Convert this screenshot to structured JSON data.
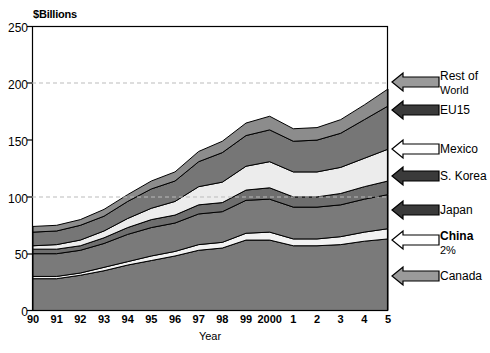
{
  "chart_data": {
    "type": "area",
    "title": "",
    "ylabel": "$Billions",
    "xlabel": "Year",
    "ylim": [
      0,
      250
    ],
    "yticks": [
      "0",
      "50",
      "100",
      "150",
      "200",
      "250"
    ],
    "ytick_values": [
      0,
      50,
      100,
      150,
      200,
      250
    ],
    "grid": "horizontal-dashed-at-100-200",
    "legend_position": "right-with-arrows",
    "categories": [
      "90",
      "91",
      "92",
      "93",
      "94",
      "95",
      "96",
      "97",
      "98",
      "99",
      "2000",
      "1",
      "2",
      "3",
      "4",
      "5"
    ],
    "x": [
      "90",
      "91",
      "92",
      "93",
      "94",
      "95",
      "96",
      "97",
      "98",
      "99",
      "2000",
      "1",
      "2",
      "3",
      "4",
      "5"
    ],
    "stacked": true,
    "series": [
      {
        "name": "Canada",
        "color": "#7a7a7a",
        "values": [
          28,
          28,
          31,
          35,
          40,
          44,
          48,
          53,
          55,
          62,
          62,
          57,
          57,
          58,
          61,
          63
        ]
      },
      {
        "name": "China",
        "color": "#f2f2f2",
        "values": [
          2,
          2,
          2,
          3,
          3,
          4,
          4,
          5,
          5,
          6,
          7,
          6,
          6,
          7,
          8,
          9
        ],
        "note": "2%"
      },
      {
        "name": "Japan",
        "color": "#7a7a7a",
        "values": [
          20,
          20,
          20,
          21,
          24,
          25,
          25,
          27,
          27,
          29,
          29,
          28,
          28,
          28,
          29,
          30
        ]
      },
      {
        "name": "S. Korea",
        "color": "#6e6e6e",
        "values": [
          4,
          4,
          4,
          5,
          6,
          7,
          7,
          8,
          8,
          9,
          10,
          9,
          9,
          10,
          11,
          12
        ]
      },
      {
        "name": "Mexico",
        "color": "#ececec",
        "values": [
          3,
          4,
          5,
          6,
          8,
          10,
          12,
          16,
          18,
          21,
          23,
          22,
          22,
          23,
          25,
          28
        ]
      },
      {
        "name": "EU15",
        "color": "#767676",
        "values": [
          12,
          12,
          13,
          13,
          15,
          17,
          18,
          22,
          26,
          27,
          28,
          27,
          28,
          30,
          34,
          38
        ]
      },
      {
        "name": "Rest of World",
        "color": "#8c8c8c",
        "values": [
          5,
          5,
          5,
          6,
          6,
          7,
          8,
          9,
          10,
          11,
          12,
          11,
          11,
          12,
          13,
          15
        ]
      }
    ],
    "totals": [
      74,
      75,
      80,
      89,
      102,
      114,
      122,
      140,
      149,
      165,
      171,
      160,
      161,
      168,
      181,
      195
    ]
  },
  "legend": {
    "items": [
      {
        "name": "rest-of-world",
        "label_line1": "Rest of",
        "label_line2": "World",
        "arrow": "gray",
        "bold": false
      },
      {
        "name": "eu15",
        "label_line1": "EU15",
        "label_line2": "",
        "arrow": "dark",
        "bold": false
      },
      {
        "name": "mexico",
        "label_line1": "Mexico",
        "label_line2": "",
        "arrow": "white",
        "bold": false
      },
      {
        "name": "s-korea",
        "label_line1": "S. Korea",
        "label_line2": "",
        "arrow": "dark",
        "bold": false
      },
      {
        "name": "japan",
        "label_line1": "Japan",
        "label_line2": "",
        "arrow": "dark",
        "bold": false
      },
      {
        "name": "china",
        "label_line1": "China",
        "label_line2": "2%",
        "arrow": "white",
        "bold": true
      },
      {
        "name": "canada",
        "label_line1": "Canada",
        "label_line2": "",
        "arrow": "gray",
        "bold": false
      }
    ]
  },
  "colors": {
    "band_dark": "#6e6e6e",
    "band_mid": "#7a7a7a",
    "band_light": "#f0f0f0",
    "band_top": "#8c8c8c",
    "axis": "#000000",
    "grid": "#bbbbbb"
  }
}
